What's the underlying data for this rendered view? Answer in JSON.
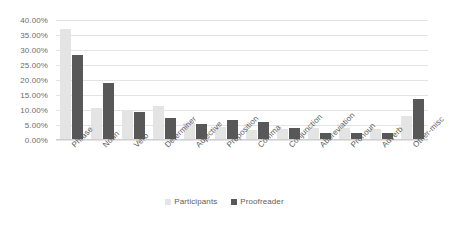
{
  "chart_data": {
    "type": "bar",
    "title": "",
    "subtitle": "",
    "xlabel": "",
    "ylabel": "",
    "ylim": [
      0,
      40
    ],
    "ytick_labels": [
      "40.00%",
      "35.00%",
      "30.00%",
      "25.00%",
      "20.00%",
      "15.00%",
      "10.00%",
      "5.00%",
      "0.00%"
    ],
    "ytick_values": [
      40,
      35,
      30,
      25,
      20,
      15,
      10,
      5,
      0
    ],
    "grid": true,
    "legend_position": "bottom-center",
    "value_suffix": "%",
    "categories": [
      "Phrase",
      "Noun",
      "Verb",
      "Determiner",
      "Adjective",
      "Preposition",
      "Comma",
      "Conjunction",
      "Abbreviation",
      "Pronoun",
      "Adverb",
      "Other-misc"
    ],
    "series": [
      {
        "name": "Participants",
        "color": "#e4e4e4",
        "values": [
          37.0,
          10.6,
          9.8,
          11.5,
          5.8,
          4.3,
          3.2,
          3.8,
          3.9,
          4.0,
          3.7,
          7.9
        ]
      },
      {
        "name": "Proofreader",
        "color": "#585858",
        "values": [
          28.3,
          19.0,
          9.2,
          7.2,
          5.2,
          6.6,
          6.1,
          4.1,
          2.3,
          2.3,
          2.3,
          13.7
        ]
      }
    ]
  },
  "legend": {
    "items": [
      {
        "label": "Participants",
        "key": "participants"
      },
      {
        "label": "Proofreader",
        "key": "proofreader"
      }
    ]
  },
  "colors": {
    "participants": "#e4e4e4",
    "proofreader": "#585858",
    "gridline": "#e4e4e4",
    "axis_text": "#6d6d6d",
    "background": "#ffffff"
  }
}
